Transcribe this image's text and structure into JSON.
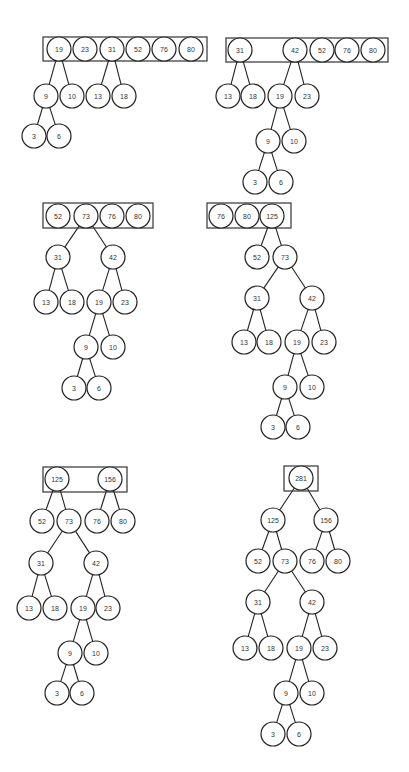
{
  "diagram": {
    "node_radius": 12,
    "colors": {
      "stroke": "#222222",
      "fill": "#ffffff",
      "text": "#333333",
      "background": "#ffffff"
    },
    "steps": [
      {
        "id": "step-1",
        "box": {
          "x": 43,
          "y": 37,
          "w": 164,
          "h": 24
        },
        "nodes": [
          {
            "id": "a19",
            "label": "19",
            "x": 59,
            "y": 49
          },
          {
            "id": "a23",
            "label": "23",
            "x": 85,
            "y": 49
          },
          {
            "id": "a31",
            "label": "31",
            "x": 112,
            "y": 49
          },
          {
            "id": "a52",
            "label": "52",
            "x": 138,
            "y": 49
          },
          {
            "id": "a76",
            "label": "76",
            "x": 164,
            "y": 49
          },
          {
            "id": "a80",
            "label": "80",
            "x": 191,
            "y": 49
          },
          {
            "id": "a9",
            "label": "9",
            "x": 46,
            "y": 96
          },
          {
            "id": "a10",
            "label": "10",
            "x": 72,
            "y": 96
          },
          {
            "id": "a13",
            "label": "13",
            "x": 98,
            "y": 96
          },
          {
            "id": "a18",
            "label": "18",
            "x": 124,
            "y": 96
          },
          {
            "id": "a3",
            "label": "3",
            "x": 34,
            "y": 136
          },
          {
            "id": "a6",
            "label": "6",
            "x": 59,
            "y": 136
          }
        ],
        "edges": [
          [
            "a19",
            "a9"
          ],
          [
            "a19",
            "a10"
          ],
          [
            "a31",
            "a13"
          ],
          [
            "a31",
            "a18"
          ],
          [
            "a9",
            "a3"
          ],
          [
            "a9",
            "a6"
          ]
        ]
      },
      {
        "id": "step-2",
        "box": {
          "x": 226,
          "y": 38,
          "w": 162,
          "h": 24
        },
        "nodes": [
          {
            "id": "b31",
            "label": "31",
            "x": 240,
            "y": 50
          },
          {
            "id": "b42",
            "label": "42",
            "x": 295,
            "y": 50
          },
          {
            "id": "b52",
            "label": "52",
            "x": 322,
            "y": 50
          },
          {
            "id": "b76",
            "label": "76",
            "x": 347,
            "y": 50
          },
          {
            "id": "b80",
            "label": "80",
            "x": 373,
            "y": 50
          },
          {
            "id": "b13",
            "label": "13",
            "x": 228,
            "y": 96
          },
          {
            "id": "b18",
            "label": "18",
            "x": 253,
            "y": 96
          },
          {
            "id": "b19",
            "label": "19",
            "x": 280,
            "y": 96
          },
          {
            "id": "b23",
            "label": "23",
            "x": 307,
            "y": 96
          },
          {
            "id": "b9",
            "label": "9",
            "x": 268,
            "y": 141
          },
          {
            "id": "b10",
            "label": "10",
            "x": 294,
            "y": 141
          },
          {
            "id": "b3",
            "label": "3",
            "x": 255,
            "y": 182
          },
          {
            "id": "b6",
            "label": "6",
            "x": 281,
            "y": 182
          }
        ],
        "edges": [
          [
            "b31",
            "b13"
          ],
          [
            "b31",
            "b18"
          ],
          [
            "b42",
            "b19"
          ],
          [
            "b42",
            "b23"
          ],
          [
            "b19",
            "b9"
          ],
          [
            "b19",
            "b10"
          ],
          [
            "b9",
            "b3"
          ],
          [
            "b9",
            "b6"
          ]
        ]
      },
      {
        "id": "step-3",
        "box": {
          "x": 43,
          "y": 203,
          "w": 110,
          "h": 25
        },
        "nodes": [
          {
            "id": "c52",
            "label": "52",
            "x": 58,
            "y": 216
          },
          {
            "id": "c73",
            "label": "73",
            "x": 86,
            "y": 216
          },
          {
            "id": "c76",
            "label": "76",
            "x": 112,
            "y": 216
          },
          {
            "id": "c80",
            "label": "80",
            "x": 138,
            "y": 216
          },
          {
            "id": "c31",
            "label": "31",
            "x": 58,
            "y": 257
          },
          {
            "id": "c42",
            "label": "42",
            "x": 113,
            "y": 257
          },
          {
            "id": "c13",
            "label": "13",
            "x": 46,
            "y": 302
          },
          {
            "id": "c18",
            "label": "18",
            "x": 72,
            "y": 302
          },
          {
            "id": "c19",
            "label": "19",
            "x": 99,
            "y": 302
          },
          {
            "id": "c23",
            "label": "23",
            "x": 125,
            "y": 302
          },
          {
            "id": "c9",
            "label": "9",
            "x": 86,
            "y": 347
          },
          {
            "id": "c10",
            "label": "10",
            "x": 113,
            "y": 347
          },
          {
            "id": "c3",
            "label": "3",
            "x": 74,
            "y": 388
          },
          {
            "id": "c6",
            "label": "6",
            "x": 99,
            "y": 388
          }
        ],
        "edges": [
          [
            "c73",
            "c31"
          ],
          [
            "c73",
            "c42"
          ],
          [
            "c31",
            "c13"
          ],
          [
            "c31",
            "c18"
          ],
          [
            "c42",
            "c19"
          ],
          [
            "c42",
            "c23"
          ],
          [
            "c19",
            "c9"
          ],
          [
            "c19",
            "c10"
          ],
          [
            "c9",
            "c3"
          ],
          [
            "c9",
            "c6"
          ]
        ]
      },
      {
        "id": "step-4",
        "box": {
          "x": 207,
          "y": 203,
          "w": 84,
          "h": 25
        },
        "nodes": [
          {
            "id": "d76",
            "label": "76",
            "x": 221,
            "y": 216
          },
          {
            "id": "d80",
            "label": "80",
            "x": 247,
            "y": 216
          },
          {
            "id": "d125",
            "label": "125",
            "x": 272,
            "y": 216
          },
          {
            "id": "d52",
            "label": "52",
            "x": 257,
            "y": 257
          },
          {
            "id": "d73",
            "label": "73",
            "x": 285,
            "y": 257
          },
          {
            "id": "d31",
            "label": "31",
            "x": 257,
            "y": 298
          },
          {
            "id": "d42",
            "label": "42",
            "x": 312,
            "y": 298
          },
          {
            "id": "d13",
            "label": "13",
            "x": 244,
            "y": 342
          },
          {
            "id": "d18",
            "label": "18",
            "x": 269,
            "y": 342
          },
          {
            "id": "d19",
            "label": "19",
            "x": 297,
            "y": 342
          },
          {
            "id": "d23",
            "label": "23",
            "x": 324,
            "y": 342
          },
          {
            "id": "d9",
            "label": "9",
            "x": 285,
            "y": 387
          },
          {
            "id": "d10",
            "label": "10",
            "x": 312,
            "y": 387
          },
          {
            "id": "d3",
            "label": "3",
            "x": 273,
            "y": 427
          },
          {
            "id": "d6",
            "label": "6",
            "x": 298,
            "y": 427
          }
        ],
        "edges": [
          [
            "d125",
            "d52"
          ],
          [
            "d125",
            "d73"
          ],
          [
            "d73",
            "d31"
          ],
          [
            "d73",
            "d42"
          ],
          [
            "d31",
            "d13"
          ],
          [
            "d31",
            "d18"
          ],
          [
            "d42",
            "d19"
          ],
          [
            "d42",
            "d23"
          ],
          [
            "d19",
            "d9"
          ],
          [
            "d19",
            "d10"
          ],
          [
            "d9",
            "d3"
          ],
          [
            "d9",
            "d6"
          ]
        ]
      },
      {
        "id": "step-5",
        "box": {
          "x": 43,
          "y": 467,
          "w": 84,
          "h": 25
        },
        "nodes": [
          {
            "id": "e125",
            "label": "125",
            "x": 57,
            "y": 479
          },
          {
            "id": "e156",
            "label": "156",
            "x": 110,
            "y": 479
          },
          {
            "id": "e52",
            "label": "52",
            "x": 42,
            "y": 521
          },
          {
            "id": "e73",
            "label": "73",
            "x": 69,
            "y": 521
          },
          {
            "id": "e76",
            "label": "76",
            "x": 97,
            "y": 521
          },
          {
            "id": "e80",
            "label": "80",
            "x": 123,
            "y": 521
          },
          {
            "id": "e31",
            "label": "31",
            "x": 41,
            "y": 563
          },
          {
            "id": "e42",
            "label": "42",
            "x": 96,
            "y": 563
          },
          {
            "id": "e13",
            "label": "13",
            "x": 29,
            "y": 608
          },
          {
            "id": "e18",
            "label": "18",
            "x": 55,
            "y": 608
          },
          {
            "id": "e19",
            "label": "19",
            "x": 83,
            "y": 608
          },
          {
            "id": "e23",
            "label": "23",
            "x": 108,
            "y": 608
          },
          {
            "id": "e9",
            "label": "9",
            "x": 70,
            "y": 653
          },
          {
            "id": "e10",
            "label": "10",
            "x": 96,
            "y": 653
          },
          {
            "id": "e3",
            "label": "3",
            "x": 57,
            "y": 693
          },
          {
            "id": "e6",
            "label": "6",
            "x": 82,
            "y": 693
          }
        ],
        "edges": [
          [
            "e125",
            "e52"
          ],
          [
            "e125",
            "e73"
          ],
          [
            "e156",
            "e76"
          ],
          [
            "e156",
            "e80"
          ],
          [
            "e73",
            "e31"
          ],
          [
            "e73",
            "e42"
          ],
          [
            "e31",
            "e13"
          ],
          [
            "e31",
            "e18"
          ],
          [
            "e42",
            "e19"
          ],
          [
            "e42",
            "e23"
          ],
          [
            "e19",
            "e9"
          ],
          [
            "e19",
            "e10"
          ],
          [
            "e9",
            "e3"
          ],
          [
            "e9",
            "e6"
          ]
        ]
      },
      {
        "id": "step-6",
        "box": {
          "x": 284,
          "y": 466,
          "w": 34,
          "h": 25
        },
        "nodes": [
          {
            "id": "f281",
            "label": "281",
            "x": 301,
            "y": 478
          },
          {
            "id": "f125",
            "label": "125",
            "x": 273,
            "y": 520
          },
          {
            "id": "f156",
            "label": "156",
            "x": 326,
            "y": 520
          },
          {
            "id": "f52",
            "label": "52",
            "x": 258,
            "y": 561
          },
          {
            "id": "f73",
            "label": "73",
            "x": 285,
            "y": 561
          },
          {
            "id": "f76",
            "label": "76",
            "x": 312,
            "y": 561
          },
          {
            "id": "f80",
            "label": "80",
            "x": 338,
            "y": 561
          },
          {
            "id": "f31",
            "label": "31",
            "x": 258,
            "y": 602
          },
          {
            "id": "f42",
            "label": "42",
            "x": 312,
            "y": 602
          },
          {
            "id": "f13",
            "label": "13",
            "x": 245,
            "y": 648
          },
          {
            "id": "f18",
            "label": "18",
            "x": 271,
            "y": 648
          },
          {
            "id": "f19",
            "label": "19",
            "x": 299,
            "y": 648
          },
          {
            "id": "f23",
            "label": "23",
            "x": 325,
            "y": 648
          },
          {
            "id": "f9",
            "label": "9",
            "x": 286,
            "y": 693
          },
          {
            "id": "f10",
            "label": "10",
            "x": 312,
            "y": 693
          },
          {
            "id": "f3",
            "label": "3",
            "x": 273,
            "y": 734
          },
          {
            "id": "f6",
            "label": "6",
            "x": 299,
            "y": 734
          }
        ],
        "edges": [
          [
            "f281",
            "f125"
          ],
          [
            "f281",
            "f156"
          ],
          [
            "f125",
            "f52"
          ],
          [
            "f125",
            "f73"
          ],
          [
            "f156",
            "f76"
          ],
          [
            "f156",
            "f80"
          ],
          [
            "f73",
            "f31"
          ],
          [
            "f73",
            "f42"
          ],
          [
            "f31",
            "f13"
          ],
          [
            "f31",
            "f18"
          ],
          [
            "f42",
            "f19"
          ],
          [
            "f42",
            "f23"
          ],
          [
            "f19",
            "f9"
          ],
          [
            "f19",
            "f10"
          ],
          [
            "f9",
            "f3"
          ],
          [
            "f9",
            "f6"
          ]
        ]
      }
    ]
  },
  "caption": {
    "text": ""
  }
}
